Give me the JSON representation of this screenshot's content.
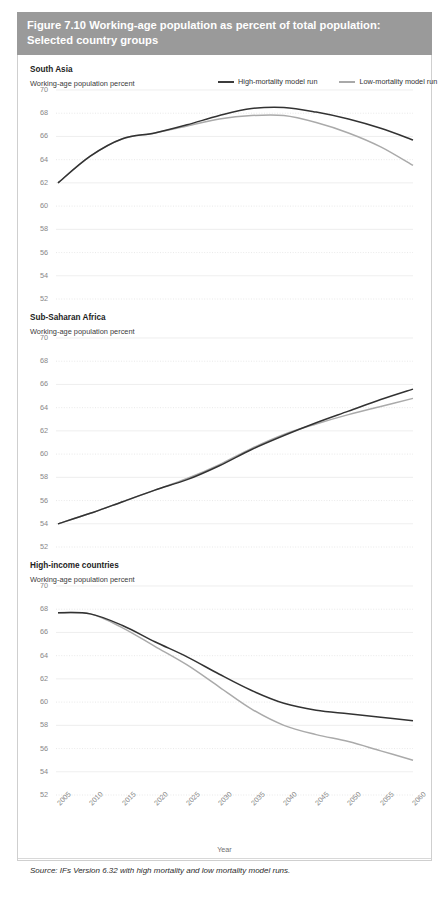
{
  "figure": {
    "title_line1": "Figure 7.10 Working-age population as percent of total population:",
    "title_line2": "Selected country groups",
    "source": "Source: IFs Version 6.32 with high mortality and low mortality model runs.",
    "xaxis_title": "Year",
    "header_color": "#9a9a9a",
    "high_color": "#323232",
    "low_color": "#aaaaaa"
  },
  "legend": {
    "high_label": "High-mortality model run",
    "low_label": "Low-mortality model run"
  },
  "chart_data": [
    {
      "type": "line",
      "title": "South Asia",
      "ylabel": "Working-age population percent",
      "xlabel": "Year",
      "x": [
        2005,
        2010,
        2015,
        2020,
        2025,
        2030,
        2035,
        2040,
        2045,
        2050,
        2055,
        2060
      ],
      "ylim": [
        52,
        70
      ],
      "yticks": [
        52,
        54,
        56,
        58,
        60,
        62,
        64,
        66,
        68,
        70
      ],
      "xticks": [
        "2005",
        "2010",
        "2015",
        "2020",
        "2025",
        "2030",
        "2035",
        "2040",
        "2045",
        "2050",
        "2055",
        "2060"
      ],
      "grid": true,
      "legend_position": "top-right",
      "series": [
        {
          "name": "High-mortality model run",
          "values": [
            62.0,
            64.3,
            65.8,
            66.3,
            67.0,
            67.8,
            68.4,
            68.5,
            68.1,
            67.5,
            66.7,
            65.7
          ]
        },
        {
          "name": "Low-mortality model run",
          "values": [
            62.0,
            64.3,
            65.8,
            66.3,
            66.9,
            67.5,
            67.8,
            67.8,
            67.2,
            66.3,
            65.1,
            63.5
          ]
        }
      ]
    },
    {
      "type": "line",
      "title": "Sub-Saharan Africa",
      "ylabel": "Working-age population percent",
      "xlabel": "Year",
      "x": [
        2005,
        2010,
        2015,
        2020,
        2025,
        2030,
        2035,
        2040,
        2045,
        2050,
        2055,
        2060
      ],
      "ylim": [
        52,
        70
      ],
      "yticks": [
        52,
        54,
        56,
        58,
        60,
        62,
        64,
        66,
        68,
        70
      ],
      "xticks": [
        "2005",
        "2010",
        "2015",
        "2020",
        "2025",
        "2030",
        "2035",
        "2040",
        "2045",
        "2050",
        "2055",
        "2060"
      ],
      "grid": true,
      "legend_position": "none",
      "series": [
        {
          "name": "High-mortality model run",
          "values": [
            54.0,
            54.9,
            55.9,
            56.9,
            57.8,
            59.0,
            60.4,
            61.6,
            62.7,
            63.7,
            64.7,
            65.6
          ]
        },
        {
          "name": "Low-mortality model run",
          "values": [
            54.0,
            54.9,
            55.9,
            56.9,
            57.9,
            59.1,
            60.5,
            61.7,
            62.6,
            63.4,
            64.1,
            64.8
          ]
        }
      ]
    },
    {
      "type": "line",
      "title": "High-income countries",
      "ylabel": "Working-age population percent",
      "xlabel": "Year",
      "x": [
        2005,
        2010,
        2015,
        2020,
        2025,
        2030,
        2035,
        2040,
        2045,
        2050,
        2055,
        2060
      ],
      "ylim": [
        52,
        70
      ],
      "yticks": [
        52,
        54,
        56,
        58,
        60,
        62,
        64,
        66,
        68,
        70
      ],
      "xticks": [
        "2005",
        "2010",
        "2015",
        "2020",
        "2025",
        "2030",
        "2035",
        "2040",
        "2045",
        "2050",
        "2055",
        "2060"
      ],
      "grid": true,
      "legend_position": "none",
      "series": [
        {
          "name": "High-mortality model run",
          "values": [
            67.7,
            67.6,
            66.6,
            65.2,
            63.9,
            62.4,
            61.0,
            59.9,
            59.3,
            59.0,
            58.7,
            58.4
          ]
        },
        {
          "name": "Low-mortality model run",
          "values": [
            67.7,
            67.6,
            66.4,
            64.8,
            63.2,
            61.3,
            59.4,
            58.0,
            57.2,
            56.6,
            55.8,
            55.0
          ]
        }
      ]
    }
  ]
}
